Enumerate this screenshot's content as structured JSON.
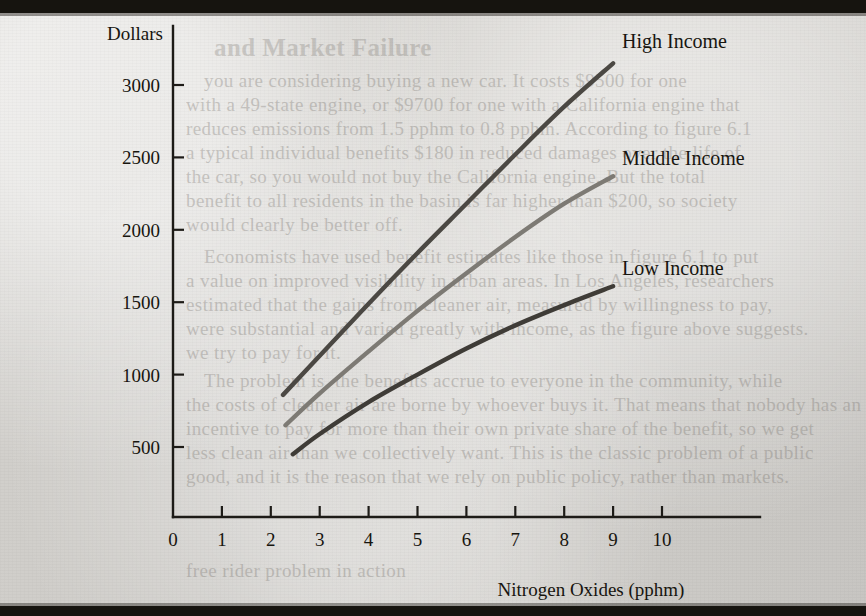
{
  "figure": {
    "background_color": "#d8d6d2",
    "ink_color": "#17150f"
  },
  "chart_data": {
    "type": "line",
    "title": "",
    "xlabel": "Nitrogen Oxides (pphm)",
    "ylabel": "Dollars",
    "xlim": [
      0,
      11.2
    ],
    "ylim": [
      0,
      3300
    ],
    "grid": false,
    "legend_position": "inline-right-of-curve-ends",
    "xticks": [
      0,
      1,
      2,
      3,
      4,
      5,
      6,
      7,
      8,
      9,
      10
    ],
    "xtick_labels": [
      "0",
      "1",
      "2",
      "3",
      "4",
      "5",
      "6",
      "7",
      "8",
      "9",
      "10"
    ],
    "yticks": [
      500,
      1000,
      1500,
      2000,
      2500,
      3000
    ],
    "ytick_labels": [
      "500",
      "1000",
      "1500",
      "2000",
      "2500",
      "3000"
    ],
    "series": [
      {
        "name": "High Income",
        "color": "#4b4843",
        "x": [
          2.25,
          3.0,
          4.0,
          5.0,
          6.0,
          7.0,
          8.0,
          9.0
        ],
        "values": [
          860,
          1130,
          1490,
          1840,
          2180,
          2520,
          2850,
          3150
        ]
      },
      {
        "name": "Middle Income",
        "color": "#7d7a74",
        "x": [
          2.3,
          3.0,
          4.0,
          5.0,
          6.0,
          7.0,
          8.0,
          9.0
        ],
        "values": [
          650,
          870,
          1160,
          1440,
          1700,
          1950,
          2180,
          2370
        ]
      },
      {
        "name": "Low Income",
        "color": "#3f3c37",
        "x": [
          2.45,
          3.0,
          4.0,
          5.0,
          6.0,
          7.0,
          8.0,
          9.0
        ],
        "values": [
          450,
          590,
          810,
          1000,
          1180,
          1340,
          1480,
          1610
        ]
      }
    ]
  },
  "series_labels": [
    {
      "text": "High Income",
      "x": 622,
      "y": 48
    },
    {
      "text": "Middle Income",
      "x": 622,
      "y": 165
    },
    {
      "text": "Low Income",
      "x": 622,
      "y": 275
    }
  ],
  "axis_titles": {
    "y": "Dollars",
    "x": "Nitrogen Oxides (pphm)"
  },
  "bleed_through_text": [
    {
      "text": "and Market Failure",
      "x": 214,
      "y": 34,
      "style": "hdr"
    },
    {
      "text": "you are considering buying a new car. It costs $9500 for one",
      "x": 204,
      "y": 70,
      "style": ""
    },
    {
      "text": "with a 49-state engine, or $9700 for one with a California engine that",
      "x": 186,
      "y": 94,
      "style": ""
    },
    {
      "text": "reduces emissions from 1.5 pphm to 0.8 pphm. According to figure 6.1",
      "x": 186,
      "y": 118,
      "style": ""
    },
    {
      "text": "a typical individual benefits $180 in reduced damages over the life of",
      "x": 186,
      "y": 142,
      "style": ""
    },
    {
      "text": "the car, so you would not buy the California engine. But the total",
      "x": 186,
      "y": 166,
      "style": ""
    },
    {
      "text": "benefit to all residents in the basin is far higher than $200, so society",
      "x": 186,
      "y": 190,
      "style": ""
    },
    {
      "text": "would clearly be better off.",
      "x": 186,
      "y": 214,
      "style": ""
    },
    {
      "text": "Economists have used benefit estimates like those in figure 6.1 to put",
      "x": 204,
      "y": 246,
      "style": ""
    },
    {
      "text": "a value on improved visibility in urban areas. In Los Angeles, researchers",
      "x": 186,
      "y": 270,
      "style": ""
    },
    {
      "text": "estimated that the gains from cleaner air, measured by willingness to pay,",
      "x": 186,
      "y": 294,
      "style": ""
    },
    {
      "text": "were substantial and varied greatly with income, as the figure above suggests.",
      "x": 186,
      "y": 318,
      "style": ""
    },
    {
      "text": "we try to pay for it.",
      "x": 186,
      "y": 342,
      "style": ""
    },
    {
      "text": "The problem is, the benefits accrue to everyone in the community, while",
      "x": 204,
      "y": 370,
      "style": ""
    },
    {
      "text": "the costs of cleaner air are borne by whoever buys it. That means that nobody has an",
      "x": 186,
      "y": 394,
      "style": ""
    },
    {
      "text": "incentive to pay for more than their own private share of the benefit, so we get",
      "x": 186,
      "y": 418,
      "style": ""
    },
    {
      "text": "less clean air than we collectively want. This is the classic problem of a public",
      "x": 186,
      "y": 442,
      "style": ""
    },
    {
      "text": "good, and it is the reason that we rely on public policy, rather than markets.",
      "x": 186,
      "y": 466,
      "style": ""
    },
    {
      "text": "free rider problem in action",
      "x": 186,
      "y": 560,
      "style": ""
    }
  ]
}
